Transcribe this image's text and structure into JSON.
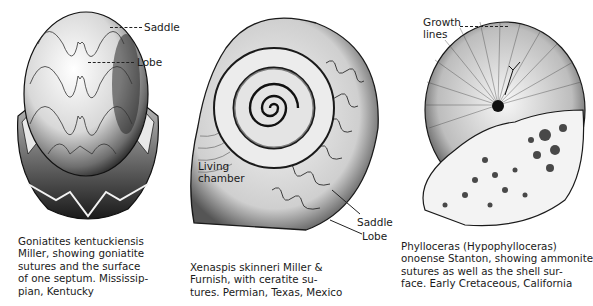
{
  "figures": [
    {
      "id": "goniatites",
      "labels": {
        "saddle": "Saddle",
        "lobe": "Lobe"
      },
      "caption_lines": [
        "Goniatites kentuckiensis",
        "Miller, showing goniatite",
        "sutures and the surface",
        "of one septum. Mississip-",
        "pian, Kentucky"
      ]
    },
    {
      "id": "xenaspis",
      "labels": {
        "living_chamber_1": "Living",
        "living_chamber_2": "chamber",
        "saddle": "Saddle",
        "lobe": "Lobe"
      },
      "caption_lines": [
        "Xenaspis skinneri Miller &",
        "Furnish, with ceratite su-",
        "tures. Permian, Texas, Mexico"
      ]
    },
    {
      "id": "phylloceras",
      "labels": {
        "growth_1": "Growth",
        "growth_2": "lines"
      },
      "caption_lines": [
        "Phylloceras (Hypophylloceras)",
        "onoense Stanton, showing ammonite",
        "sutures as well as the shell sur-",
        "face. Early Cretaceous, California"
      ]
    }
  ],
  "colors": {
    "ink": "#1a1a1a",
    "shade": "#6b6b6b",
    "light": "#d9d9d9",
    "paper": "#ffffff"
  }
}
